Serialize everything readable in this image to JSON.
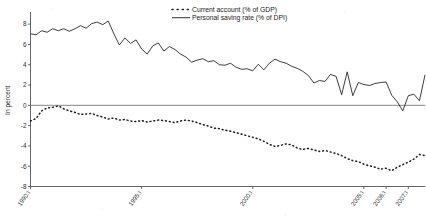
{
  "chart_data": {
    "type": "line",
    "title": "",
    "xlabel": "",
    "ylabel": "In percent",
    "ylim": [
      -8,
      9
    ],
    "yticks": [
      8,
      6,
      4,
      2,
      0,
      -2,
      -4,
      -6,
      -8
    ],
    "ytick_labels": [
      "8",
      "6",
      "4",
      "2",
      "0",
      "-2",
      "-4",
      "-6",
      "-8"
    ],
    "grid": false,
    "legend_position": "top-center",
    "xtick_labels": [
      "1990:I",
      "1995:I",
      "2000:I",
      "2005:I",
      "2006:I",
      "2007:I"
    ],
    "xtick_index": [
      0,
      20,
      40,
      60,
      64,
      68
    ],
    "x_count": 72,
    "zero_line": 0,
    "series": [
      {
        "name": "Current account (% of GDP)",
        "style": "dotted",
        "color": "#1a1a1a",
        "values": [
          -1.55,
          -1.3,
          -0.55,
          -0.25,
          -0.2,
          -0.05,
          -0.35,
          -0.55,
          -0.7,
          -0.9,
          -0.85,
          -0.8,
          -1.0,
          -1.15,
          -1.35,
          -1.25,
          -1.45,
          -1.4,
          -1.55,
          -1.6,
          -1.5,
          -1.65,
          -1.55,
          -1.45,
          -1.5,
          -1.6,
          -1.7,
          -1.55,
          -1.45,
          -1.55,
          -1.7,
          -1.9,
          -2.05,
          -2.25,
          -2.3,
          -2.45,
          -2.55,
          -2.7,
          -2.85,
          -3.0,
          -3.15,
          -3.3,
          -3.55,
          -3.85,
          -4.05,
          -3.95,
          -3.8,
          -3.9,
          -4.2,
          -4.35,
          -4.25,
          -4.4,
          -4.55,
          -4.45,
          -4.6,
          -4.75,
          -4.95,
          -5.25,
          -5.45,
          -5.55,
          -5.8,
          -5.95,
          -6.1,
          -6.3,
          -6.2,
          -6.45,
          -6.1,
          -5.85,
          -5.6,
          -5.3,
          -4.85,
          -4.95
        ]
      },
      {
        "name": "Personal saving rate (% of DPI)",
        "style": "solid",
        "color": "#1a1a1a",
        "values": [
          7.05,
          6.95,
          7.35,
          7.2,
          7.55,
          7.35,
          7.55,
          7.3,
          7.55,
          7.85,
          7.6,
          8.05,
          8.2,
          7.95,
          8.3,
          7.05,
          5.95,
          6.65,
          6.1,
          6.45,
          5.55,
          5.05,
          5.85,
          6.15,
          5.35,
          5.8,
          5.5,
          5.05,
          4.75,
          4.25,
          4.45,
          4.6,
          4.3,
          4.4,
          4.0,
          3.95,
          4.15,
          3.75,
          3.55,
          3.6,
          3.4,
          4.05,
          3.5,
          4.15,
          4.55,
          4.3,
          4.15,
          3.85,
          3.65,
          3.35,
          2.95,
          2.2,
          2.45,
          2.35,
          3.05,
          2.85,
          1.05,
          3.3,
          0.95,
          2.25,
          2.05,
          1.95,
          2.15,
          2.25,
          2.3,
          1.0,
          0.35,
          -0.55,
          0.95,
          1.1,
          0.45,
          3.0
        ]
      }
    ]
  }
}
